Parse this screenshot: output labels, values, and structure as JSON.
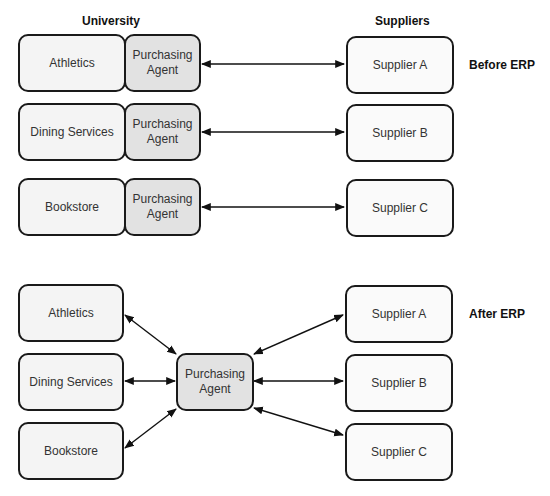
{
  "headers": {
    "university": "University",
    "suppliers": "Suppliers",
    "before": "Before ERP",
    "after": "After ERP"
  },
  "before": {
    "rows": [
      {
        "department": "Athletics",
        "agent": "Purchasing Agent",
        "supplier": "Supplier A"
      },
      {
        "department": "Dining Services",
        "agent": "Purchasing Agent",
        "supplier": "Supplier B"
      },
      {
        "department": "Bookstore",
        "agent": "Purchasing Agent",
        "supplier": "Supplier C"
      }
    ]
  },
  "after": {
    "departments": [
      "Athletics",
      "Dining Services",
      "Bookstore"
    ],
    "agent": "Purchasing Agent",
    "suppliers": [
      "Supplier A",
      "Supplier B",
      "Supplier C"
    ]
  },
  "colors": {
    "border": "#1a1a1a",
    "box_fill": "#f4f4f4",
    "agent_fill": "#e2e2e2"
  }
}
